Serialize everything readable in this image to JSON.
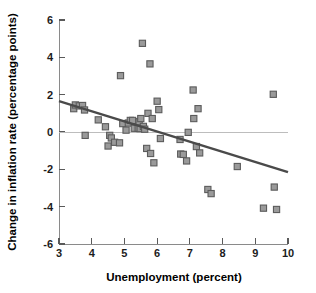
{
  "chart_data": {
    "type": "scatter",
    "title": "",
    "xlabel": "Unemployment (percent)",
    "ylabel": "Change in inflation rate (percentage points)",
    "xlim": [
      3,
      10
    ],
    "ylim": [
      -6,
      6
    ],
    "xticks": [
      3,
      4,
      5,
      6,
      7,
      8,
      9,
      10
    ],
    "xtick_labels": [
      "3",
      "4",
      "5",
      "6",
      "7",
      "8",
      "9",
      "10"
    ],
    "yticks": [
      -6,
      -4,
      -2,
      0,
      2,
      4,
      6
    ],
    "ytick_labels": [
      "-6",
      "-4",
      "-2",
      "0",
      "2",
      "4",
      "6"
    ],
    "grid": false,
    "legend": "none",
    "zero_reference_line": 0,
    "marker_style": "square",
    "marker_fill": "#9a9a9a",
    "marker_edge": "#5b5b5b",
    "trend_line": {
      "label": "fitted regression line",
      "color": "#4a4a4a",
      "x_start": 3.0,
      "y_start": 1.65,
      "x_end": 10.0,
      "y_end": -2.15,
      "slope": -0.543,
      "intercept": 3.28
    },
    "points": [
      {
        "x": 3.45,
        "y": 1.25
      },
      {
        "x": 3.5,
        "y": 1.45
      },
      {
        "x": 3.62,
        "y": 1.4
      },
      {
        "x": 3.72,
        "y": 1.42
      },
      {
        "x": 3.78,
        "y": 1.18
      },
      {
        "x": 3.8,
        "y": -0.18
      },
      {
        "x": 4.2,
        "y": 0.65
      },
      {
        "x": 4.42,
        "y": 0.28
      },
      {
        "x": 4.5,
        "y": -0.75
      },
      {
        "x": 4.55,
        "y": -0.18
      },
      {
        "x": 4.6,
        "y": -0.32
      },
      {
        "x": 4.7,
        "y": -0.55
      },
      {
        "x": 4.85,
        "y": -0.58
      },
      {
        "x": 4.88,
        "y": 3.02
      },
      {
        "x": 4.95,
        "y": 0.45
      },
      {
        "x": 5.05,
        "y": 0.1
      },
      {
        "x": 5.12,
        "y": 0.48
      },
      {
        "x": 5.18,
        "y": 0.62
      },
      {
        "x": 5.25,
        "y": 0.62
      },
      {
        "x": 5.3,
        "y": 0.2
      },
      {
        "x": 5.42,
        "y": 0.2
      },
      {
        "x": 5.45,
        "y": 0.55
      },
      {
        "x": 5.48,
        "y": 0.18
      },
      {
        "x": 5.5,
        "y": 0.72
      },
      {
        "x": 5.55,
        "y": 4.75
      },
      {
        "x": 5.58,
        "y": 0.3
      },
      {
        "x": 5.62,
        "y": 0.15
      },
      {
        "x": 5.68,
        "y": -0.88
      },
      {
        "x": 5.72,
        "y": 1.0
      },
      {
        "x": 5.78,
        "y": 3.65
      },
      {
        "x": 5.8,
        "y": -1.15
      },
      {
        "x": 5.85,
        "y": 0.72
      },
      {
        "x": 5.9,
        "y": -1.65
      },
      {
        "x": 6.0,
        "y": 1.65
      },
      {
        "x": 6.05,
        "y": 1.2
      },
      {
        "x": 6.1,
        "y": -0.35
      },
      {
        "x": 6.7,
        "y": -0.4
      },
      {
        "x": 6.72,
        "y": -1.18
      },
      {
        "x": 6.8,
        "y": -1.2
      },
      {
        "x": 6.9,
        "y": -1.55
      },
      {
        "x": 6.95,
        "y": -0.02
      },
      {
        "x": 7.1,
        "y": 2.25
      },
      {
        "x": 7.12,
        "y": 0.72
      },
      {
        "x": 7.2,
        "y": -0.78
      },
      {
        "x": 7.25,
        "y": 1.25
      },
      {
        "x": 7.3,
        "y": -1.12
      },
      {
        "x": 7.55,
        "y": -3.08
      },
      {
        "x": 7.65,
        "y": -3.3
      },
      {
        "x": 8.45,
        "y": -1.85
      },
      {
        "x": 9.25,
        "y": -4.08
      },
      {
        "x": 9.55,
        "y": 2.02
      },
      {
        "x": 9.58,
        "y": -2.95
      },
      {
        "x": 9.65,
        "y": -4.15
      }
    ]
  }
}
